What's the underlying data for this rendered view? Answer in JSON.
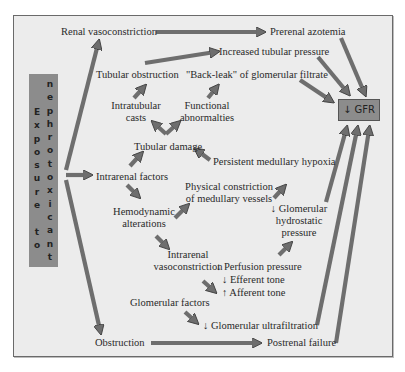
{
  "diagram": {
    "colors": {
      "background": "#ececec",
      "arrow": "#6e6e6e",
      "arrow_stroke": "#3f3f3f",
      "box": "#8c8c8c",
      "text": "#2a2a2a"
    },
    "source_box": {
      "line1": [
        "E",
        "x",
        "p",
        "o",
        "s",
        "u",
        "r",
        "e",
        "",
        "t",
        "o"
      ],
      "line2": [
        "n",
        "e",
        "p",
        "h",
        "r",
        "o",
        "t",
        "o",
        "x",
        "i",
        "c",
        "a",
        "n",
        "t"
      ],
      "text": "Exposure to nephrotoxicant"
    },
    "target_box": {
      "label": "↓ GFR"
    },
    "nodes": {
      "renal_vasoconstriction": "Renal vasoconstriction",
      "prerenal_azotemia": "Prerenal azotemia",
      "increased_tubular_pressure": "Increased tubular pressure",
      "tubular_obstruction": "Tubular obstruction",
      "back_leak": "\"Back-leak\" of glomerular filtrate",
      "intratubular_casts_1": "Intratubular",
      "intratubular_casts_2": "casts",
      "functional_abnormalities_1": "Functional",
      "functional_abnormalities_2": "abnormalties",
      "tubular_damage": "Tubular damage",
      "persistent_medullary_hypoxia": "Persistent medullary hypoxia",
      "intrarenal_factors": "Intrarenal factors",
      "physical_constriction_1": "Physical constriction",
      "physical_constriction_2": "of medullary vessels",
      "hemodynamic_alterations_1": "Hemodynamic",
      "hemodynamic_alterations_2": "alterations",
      "glomerular_hydrostatic_1": "↓ Glomerular",
      "glomerular_hydrostatic_2": "hydrostatic",
      "glomerular_hydrostatic_3": "pressure",
      "intrarenal_vasoconstriction_1": "Intrarenal",
      "intrarenal_vasoconstriction_2": "vasoconstriction",
      "perfusion_pressure": "↓ Perfusion pressure",
      "efferent_tone": "↓ Efferent tone",
      "afferent_tone": "↑ Afferent tone",
      "glomerular_factors": "Glomerular factors",
      "glomerular_ultrafiltration": "↓ Glomerular ultrafiltration",
      "obstruction": "Obstruction",
      "postrenal_failure": "Postrenal failure"
    }
  }
}
